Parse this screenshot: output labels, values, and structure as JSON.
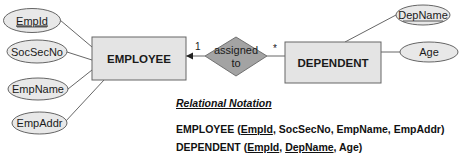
{
  "diagram": {
    "entities": [
      {
        "id": "employee",
        "label": "EMPLOYEE"
      },
      {
        "id": "dependent",
        "label": "DEPENDENT"
      }
    ],
    "relationship": {
      "label_line1": "assigned",
      "label_line2": "to"
    },
    "cardinality": {
      "employee_side": "1",
      "dependent_side": "*"
    },
    "employee_attributes": [
      {
        "label": "EmpId",
        "key": true
      },
      {
        "label": "SocSecNo",
        "key": false
      },
      {
        "label": "EmpName",
        "key": false
      },
      {
        "label": "EmpAddr",
        "key": false
      }
    ],
    "dependent_attributes": [
      {
        "label": "DepName",
        "key": true
      },
      {
        "label": "Age",
        "key": false
      }
    ],
    "colors": {
      "entity_fill": "#e4e4e4",
      "attribute_fill": "#e8e8e8",
      "relationship_fill": "#a3a3a3",
      "stroke": "#555555"
    }
  },
  "relational_notation": {
    "title": "Relational Notation",
    "employee": {
      "name": "EMPLOYEE",
      "open": " (",
      "fields": [
        "EmpId",
        ", SocSecNo, EmpName, EmpAddr"
      ],
      "close": ")"
    },
    "dependent": {
      "name": "DEPENDENT",
      "open": " (",
      "fields": [
        "EmpId",
        ", ",
        "DepName",
        ", Age"
      ],
      "close": ")"
    }
  }
}
